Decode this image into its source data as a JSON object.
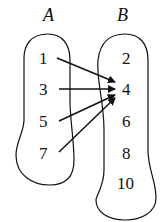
{
  "diagram": {
    "type": "mapping",
    "sets": [
      {
        "name": "A",
        "elements": [
          "1",
          "3",
          "5",
          "7"
        ]
      },
      {
        "name": "B",
        "elements": [
          "2",
          "4",
          "6",
          "8",
          "10"
        ]
      }
    ],
    "arrows": [
      {
        "from": "1",
        "to": "4"
      },
      {
        "from": "3",
        "to": "4"
      },
      {
        "from": "5",
        "to": "4"
      },
      {
        "from": "7",
        "to": "4"
      }
    ],
    "colors": {
      "stroke": "#111111",
      "background": "#ffffff"
    }
  }
}
